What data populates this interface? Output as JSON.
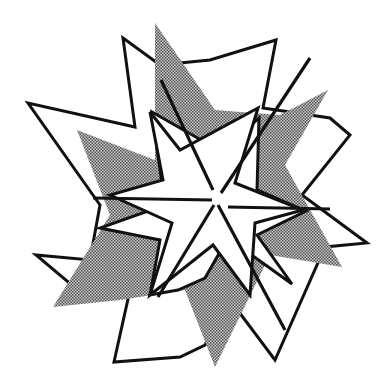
{
  "figure": {
    "colors": {
      "background": "#ffffff",
      "stroke": "#111111",
      "shade": "#8a8a8a"
    }
  }
}
